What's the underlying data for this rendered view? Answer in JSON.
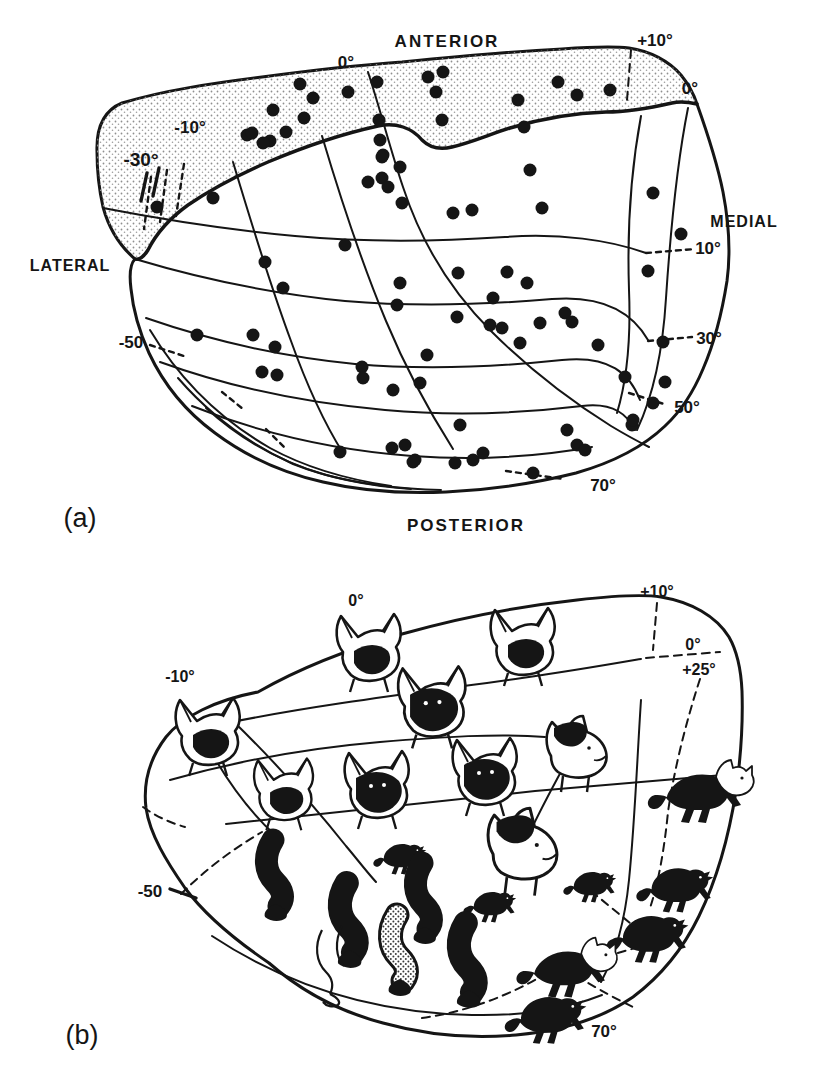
{
  "colors": {
    "paper": "#ffffff",
    "ink": "#151515",
    "stipple": "#8f8f8f"
  },
  "panel_a": {
    "caption": "(a)",
    "dot_radius": 6.5,
    "labels": [
      {
        "text": "ANTERIOR",
        "x": 447,
        "y": 47,
        "size": 17,
        "weight": 700,
        "spacing": 2
      },
      {
        "text": "0°",
        "x": 346,
        "y": 68,
        "size": 17,
        "weight": 700
      },
      {
        "text": "+10°",
        "x": 655,
        "y": 46,
        "size": 17,
        "weight": 700
      },
      {
        "text": "0°",
        "x": 690,
        "y": 94,
        "size": 17,
        "weight": 700
      },
      {
        "text": "-10°",
        "x": 190,
        "y": 133,
        "size": 17,
        "weight": 700
      },
      {
        "text": "-30°",
        "x": 141,
        "y": 166,
        "size": 19,
        "weight": 700
      },
      {
        "text": "LATERAL",
        "x": 70,
        "y": 271,
        "size": 16,
        "weight": 700,
        "spacing": 1
      },
      {
        "text": "MEDIAL",
        "x": 744,
        "y": 227,
        "size": 16,
        "weight": 700,
        "spacing": 1
      },
      {
        "text": "10°",
        "x": 708,
        "y": 254,
        "size": 17,
        "weight": 700
      },
      {
        "text": "-50",
        "x": 131,
        "y": 348,
        "size": 17,
        "weight": 700
      },
      {
        "text": "30°",
        "x": 709,
        "y": 344,
        "size": 17,
        "weight": 700
      },
      {
        "text": "50°",
        "x": 687,
        "y": 413,
        "size": 17,
        "weight": 700
      },
      {
        "text": "70°",
        "x": 603,
        "y": 491,
        "size": 17,
        "weight": 700
      },
      {
        "text": "POSTERIOR",
        "x": 466,
        "y": 531,
        "size": 17,
        "weight": 700,
        "spacing": 2
      },
      {
        "text": "(a)",
        "x": 80,
        "y": 527,
        "size": 27,
        "weight": 400
      }
    ],
    "dots": [
      [
        247,
        135
      ],
      [
        270,
        141
      ],
      [
        273,
        110
      ],
      [
        286,
        132
      ],
      [
        304,
        118
      ],
      [
        313,
        98
      ],
      [
        300,
        84
      ],
      [
        348,
        92
      ],
      [
        377,
        82
      ],
      [
        428,
        77
      ],
      [
        443,
        72
      ],
      [
        436,
        92
      ],
      [
        379,
        120
      ],
      [
        442,
        120
      ],
      [
        518,
        100
      ],
      [
        524,
        127
      ],
      [
        558,
        82
      ],
      [
        577,
        95
      ],
      [
        610,
        90
      ],
      [
        252,
        133
      ],
      [
        263,
        143
      ],
      [
        213,
        198
      ],
      [
        157,
        207
      ],
      [
        383,
        155
      ],
      [
        400,
        167
      ],
      [
        368,
        182
      ],
      [
        382,
        178
      ],
      [
        388,
        187
      ],
      [
        402,
        203
      ],
      [
        380,
        140
      ],
      [
        382,
        157
      ],
      [
        453,
        213
      ],
      [
        472,
        210
      ],
      [
        345,
        245
      ],
      [
        265,
        262
      ],
      [
        283,
        288
      ],
      [
        400,
        283
      ],
      [
        397,
        305
      ],
      [
        458,
        273
      ],
      [
        507,
        272
      ],
      [
        493,
        298
      ],
      [
        457,
        317
      ],
      [
        530,
        170
      ],
      [
        542,
        208
      ],
      [
        653,
        193
      ],
      [
        681,
        234
      ],
      [
        648,
        271
      ],
      [
        527,
        283
      ],
      [
        565,
        313
      ],
      [
        572,
        322
      ],
      [
        540,
        323
      ],
      [
        490,
        325
      ],
      [
        502,
        328
      ],
      [
        520,
        343
      ],
      [
        598,
        345
      ],
      [
        663,
        342
      ],
      [
        197,
        335
      ],
      [
        253,
        335
      ],
      [
        275,
        347
      ],
      [
        262,
        372
      ],
      [
        277,
        375
      ],
      [
        362,
        367
      ],
      [
        363,
        378
      ],
      [
        393,
        390
      ],
      [
        420,
        383
      ],
      [
        427,
        355
      ],
      [
        340,
        452
      ],
      [
        392,
        448
      ],
      [
        405,
        445
      ],
      [
        415,
        460
      ],
      [
        460,
        425
      ],
      [
        413,
        462
      ],
      [
        455,
        463
      ],
      [
        473,
        460
      ],
      [
        483,
        453
      ],
      [
        533,
        473
      ],
      [
        567,
        430
      ],
      [
        577,
        445
      ],
      [
        585,
        450
      ],
      [
        632,
        425
      ],
      [
        625,
        377
      ],
      [
        665,
        382
      ],
      [
        653,
        403
      ],
      [
        633,
        420
      ]
    ]
  },
  "panel_b": {
    "caption": "(b)",
    "labels": [
      {
        "text": "0°",
        "x": 356,
        "y": 606,
        "size": 16,
        "weight": 700
      },
      {
        "text": "+10°",
        "x": 657,
        "y": 597,
        "size": 16,
        "weight": 700
      },
      {
        "text": "0°",
        "x": 693,
        "y": 650,
        "size": 16,
        "weight": 700
      },
      {
        "text": "+25°",
        "x": 699,
        "y": 675,
        "size": 16,
        "weight": 700
      },
      {
        "text": "-10°",
        "x": 180,
        "y": 682,
        "size": 16,
        "weight": 700
      },
      {
        "text": "-50",
        "x": 150,
        "y": 897,
        "size": 17,
        "weight": 700
      },
      {
        "text": "70°",
        "x": 604,
        "y": 1037,
        "size": 17,
        "weight": 700
      },
      {
        "text": "(b)",
        "x": 82,
        "y": 1044,
        "size": 27,
        "weight": 400
      }
    ],
    "cats": [
      {
        "type": "head-back",
        "x": 367,
        "y": 646,
        "scale": 1.0
      },
      {
        "type": "head-back",
        "x": 521,
        "y": 640,
        "scale": 1.0
      },
      {
        "type": "head-black",
        "x": 430,
        "y": 700,
        "scale": 1.05
      },
      {
        "type": "head-back",
        "x": 206,
        "y": 730,
        "scale": 1.0
      },
      {
        "type": "head-back",
        "x": 282,
        "y": 788,
        "scale": 0.92
      },
      {
        "type": "head-black",
        "x": 375,
        "y": 783,
        "scale": 1.0
      },
      {
        "type": "head-black",
        "x": 483,
        "y": 770,
        "scale": 1.0
      },
      {
        "type": "head-profile",
        "x": 577,
        "y": 748,
        "scale": 1.0
      },
      {
        "type": "head-profile",
        "x": 523,
        "y": 845,
        "scale": 1.15
      },
      {
        "type": "cat-white-head",
        "x": 700,
        "y": 793,
        "scale": 1.0
      },
      {
        "type": "cat-black",
        "x": 592,
        "y": 887,
        "scale": 0.55
      },
      {
        "type": "cat-black",
        "x": 678,
        "y": 890,
        "scale": 0.8
      },
      {
        "type": "cat-black",
        "x": 651,
        "y": 939,
        "scale": 0.85
      },
      {
        "type": "cat-white-head",
        "x": 566,
        "y": 969,
        "scale": 0.95
      },
      {
        "type": "cat-black",
        "x": 549,
        "y": 1020,
        "scale": 0.85
      },
      {
        "type": "cat-black",
        "x": 492,
        "y": 907,
        "scale": 0.55
      },
      {
        "type": "cat-black",
        "x": 402,
        "y": 859,
        "scale": 0.55
      },
      {
        "type": "limb",
        "x": 278,
        "y": 880,
        "scale": 1.0
      },
      {
        "type": "limb",
        "x": 352,
        "y": 925,
        "scale": 1.05
      },
      {
        "type": "limb",
        "x": 427,
        "y": 903,
        "scale": 1.0
      },
      {
        "type": "limb",
        "x": 471,
        "y": 965,
        "scale": 1.05
      },
      {
        "type": "limb-stippled",
        "x": 402,
        "y": 955,
        "scale": 1.0
      },
      {
        "type": "limb-outline",
        "x": 335,
        "y": 966,
        "scale": 1.0
      }
    ]
  }
}
